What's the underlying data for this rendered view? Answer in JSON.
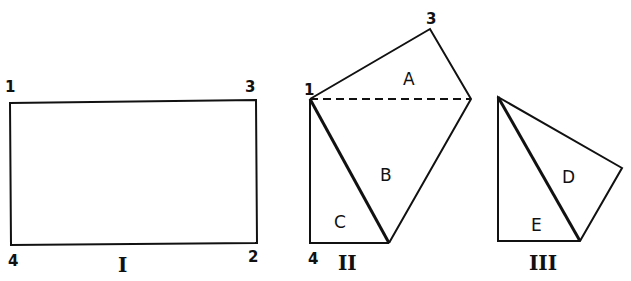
{
  "diagram": {
    "figure_I": {
      "caption": "I",
      "corners": {
        "top_left": "1",
        "top_right": "3",
        "bottom_right": "2",
        "bottom_left": "4"
      }
    },
    "figure_II": {
      "caption": "II",
      "vertices": {
        "top": "3",
        "left": "1",
        "bottom_left": "4"
      },
      "regions": [
        "A",
        "B",
        "C"
      ]
    },
    "figure_III": {
      "caption": "III",
      "regions": [
        "D",
        "E"
      ]
    },
    "colors": {
      "stroke": "#111111",
      "background": "#ffffff"
    }
  }
}
